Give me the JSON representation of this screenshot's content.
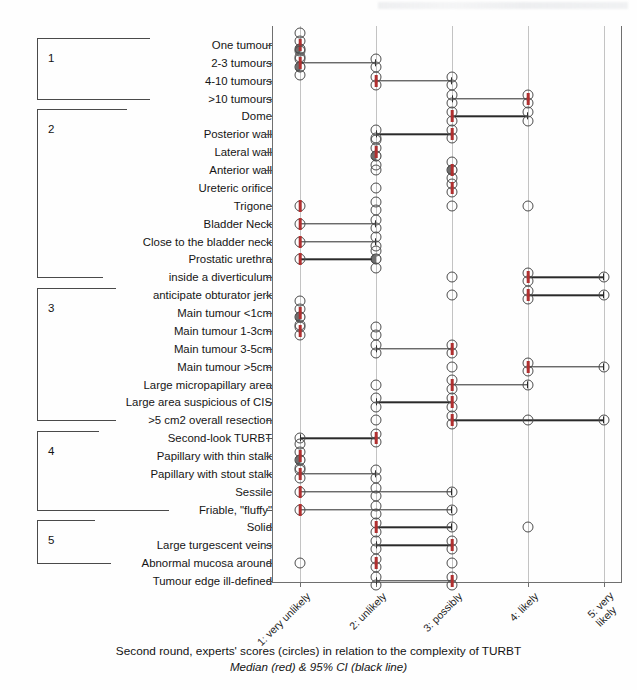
{
  "figure": {
    "caption_line1": "Second round, experts' scores (circles) in relation to the complexity of TURBT",
    "caption_line2": "Median (red) & 95% CI (black line)"
  },
  "colors": {
    "median": "#b03030",
    "ci_line": "#2a2a2a",
    "marker_outline": "#4c4c4c",
    "gridline": "#c3c3c3",
    "axis": "#6f6f6f"
  },
  "groups": [
    {
      "number": "1",
      "first_row": 0,
      "last_row": 3
    },
    {
      "number": "2",
      "first_row": 4,
      "last_row": 13
    },
    {
      "number": "3",
      "first_row": 14,
      "last_row": 21
    },
    {
      "number": "4",
      "first_row": 22,
      "last_row": 26
    },
    {
      "number": "5",
      "first_row": 27,
      "last_row": 29
    }
  ],
  "chart_data": {
    "type": "scatter",
    "title": "",
    "xlabel": "",
    "ylabel": "",
    "xlim": [
      0.5,
      5.5
    ],
    "grid": true,
    "legend": "none",
    "x_tick_values": [
      1,
      2,
      3,
      4,
      5
    ],
    "x_tick_labels": [
      "1: very unlikely",
      "2: unlikely",
      "3: possibly",
      "4: likely",
      "5: very likely"
    ],
    "categories": [
      "One tumour",
      "2-3 tumours",
      "4-10 tumours",
      ">10 tumours",
      "Dome",
      "Posterior wall",
      "Lateral wall",
      "Anterior wall",
      "Ureteric orifice",
      "Trigone",
      "Bladder Neck",
      "Close to the bladder neck",
      "Prostatic urethra",
      "inside a diverticulum",
      "anticipate obturator jerk",
      "Main tumour <1cm",
      "Main tumour 1-3cm",
      "Main tumour 3-5cm",
      "Main tumour >5cm",
      "Large micropapillary area",
      "Large area suspicious of CIS",
      ">5 cm2 overall resection",
      "Second-look TURBT",
      "Papillary with  thin stalk",
      "Papillary with stout stalk",
      "Sessile",
      "Friable, \"fluffy\"",
      "Solid",
      "Large turgescent veins",
      "Abnormal mucosa around",
      "Tumour edge ill-defined"
    ],
    "rows": [
      {
        "label": "One tumour",
        "scores": [
          1,
          1,
          1,
          1
        ],
        "median": 1,
        "ci": [
          1,
          1
        ]
      },
      {
        "label": "2-3 tumours",
        "scores": [
          1,
          1,
          1,
          1,
          2,
          2
        ],
        "median": 1,
        "ci": [
          1,
          2
        ]
      },
      {
        "label": "4-10 tumours",
        "scores": [
          2,
          2,
          3,
          3
        ],
        "median": 2,
        "ci": [
          2,
          3
        ]
      },
      {
        "label": ">10 tumours",
        "scores": [
          3,
          3,
          4,
          4
        ],
        "median": 4,
        "ci": [
          3,
          4
        ]
      },
      {
        "label": "Dome",
        "scores": [
          3,
          3,
          4,
          4
        ],
        "median": 3,
        "ci": [
          3,
          4
        ]
      },
      {
        "label": "Posterior wall",
        "scores": [
          2,
          2,
          3,
          3
        ],
        "median": 3,
        "ci": [
          2,
          3
        ]
      },
      {
        "label": "Lateral wall",
        "scores": [
          2,
          2,
          2,
          2
        ],
        "median": 2,
        "ci": [
          2,
          2
        ]
      },
      {
        "label": "Anterior wall",
        "scores": [
          2,
          3,
          3,
          3
        ],
        "median": 3,
        "ci": [
          3,
          3
        ]
      },
      {
        "label": "Ureteric orifice",
        "scores": [
          2,
          3,
          3
        ],
        "median": 3,
        "ci": [
          3,
          3
        ]
      },
      {
        "label": "Trigone",
        "scores": [
          1,
          2,
          2,
          3,
          4
        ],
        "median": 1,
        "ci": null
      },
      {
        "label": "Bladder Neck",
        "scores": [
          1,
          2,
          2
        ],
        "median": 1,
        "ci": [
          1,
          2
        ]
      },
      {
        "label": "Close to the bladder neck",
        "scores": [
          1,
          2,
          2
        ],
        "median": 1,
        "ci": [
          1,
          2
        ]
      },
      {
        "label": "Prostatic urethra",
        "scores": [
          1,
          2,
          2,
          2
        ],
        "median": 1,
        "ci": [
          1,
          2
        ]
      },
      {
        "label": "inside a diverticulum",
        "scores": [
          3,
          4,
          4,
          5
        ],
        "median": 4,
        "ci": [
          4,
          5
        ]
      },
      {
        "label": "anticipate obturator jerk",
        "scores": [
          3,
          4,
          4,
          5
        ],
        "median": 4,
        "ci": [
          4,
          5
        ]
      },
      {
        "label": "Main tumour <1cm",
        "scores": [
          1,
          1,
          1,
          1
        ],
        "median": 1,
        "ci": [
          1,
          1
        ]
      },
      {
        "label": "Main tumour 1-3cm",
        "scores": [
          1,
          1,
          2,
          2
        ],
        "median": 1,
        "ci": [
          1,
          1
        ]
      },
      {
        "label": "Main tumour 3-5cm",
        "scores": [
          2,
          2,
          3,
          3
        ],
        "median": 3,
        "ci": [
          2,
          3
        ]
      },
      {
        "label": "Main tumour >5cm",
        "scores": [
          3,
          4,
          4,
          5
        ],
        "median": 4,
        "ci": [
          4,
          5
        ]
      },
      {
        "label": "Large micropapillary area",
        "scores": [
          2,
          3,
          3,
          4
        ],
        "median": 3,
        "ci": [
          3,
          4
        ]
      },
      {
        "label": "Large area suspicious of CIS",
        "scores": [
          2,
          2,
          3,
          3
        ],
        "median": 3,
        "ci": [
          2,
          3
        ]
      },
      {
        "label": ">5 cm2 overall resection",
        "scores": [
          2,
          3,
          3,
          4,
          5
        ],
        "median": 3,
        "ci": [
          3,
          5
        ]
      },
      {
        "label": "Second-look TURBT",
        "scores": [
          1,
          2,
          2
        ],
        "median": 2,
        "ci": [
          1,
          2
        ]
      },
      {
        "label": "Papillary with  thin stalk",
        "scores": [
          1,
          1,
          1,
          1
        ],
        "median": 1,
        "ci": [
          1,
          1
        ]
      },
      {
        "label": "Papillary with stout stalk",
        "scores": [
          1,
          1,
          2,
          2
        ],
        "median": 1,
        "ci": [
          1,
          2
        ]
      },
      {
        "label": "Sessile",
        "scores": [
          1,
          2,
          2,
          3
        ],
        "median": 1,
        "ci": [
          1,
          3
        ]
      },
      {
        "label": "Friable, \"fluffy\"",
        "scores": [
          1,
          2,
          2,
          3
        ],
        "median": 1,
        "ci": [
          1,
          3
        ]
      },
      {
        "label": "Solid",
        "scores": [
          2,
          2,
          3,
          4
        ],
        "median": 2,
        "ci": [
          2,
          3
        ]
      },
      {
        "label": "Large turgescent veins",
        "scores": [
          2,
          2,
          3,
          3
        ],
        "median": 3,
        "ci": [
          2,
          3
        ]
      },
      {
        "label": "Abnormal mucosa around",
        "scores": [
          1,
          2,
          2,
          3
        ],
        "median": 2,
        "ci": null
      },
      {
        "label": "Tumour edge ill-defined",
        "scores": [
          2,
          2,
          3,
          3
        ],
        "median": 3,
        "ci": [
          2,
          3
        ]
      }
    ]
  }
}
